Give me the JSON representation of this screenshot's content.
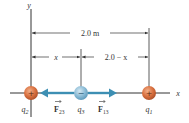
{
  "diagram": {
    "axes": {
      "x_label": "x",
      "y_label": "y"
    },
    "dimensions": {
      "total": "2.0 m",
      "left_segment": "x",
      "right_segment": "2.0 − x"
    },
    "charges": [
      {
        "id": "q2",
        "label": "q",
        "sub": "2",
        "sign": "+",
        "color": "#d9703f"
      },
      {
        "id": "q3",
        "label": "q",
        "sub": "3",
        "sign": "−",
        "color": "#7fb3cf"
      },
      {
        "id": "q1",
        "label": "q",
        "sub": "1",
        "sign": "+",
        "color": "#d9703f"
      }
    ],
    "forces": [
      {
        "id": "F23",
        "label": "F",
        "sub": "23",
        "direction": "left",
        "color": "#3d8fb3"
      },
      {
        "id": "F13",
        "label": "F",
        "sub": "13",
        "direction": "right",
        "color": "#3d8fb3"
      }
    ]
  }
}
